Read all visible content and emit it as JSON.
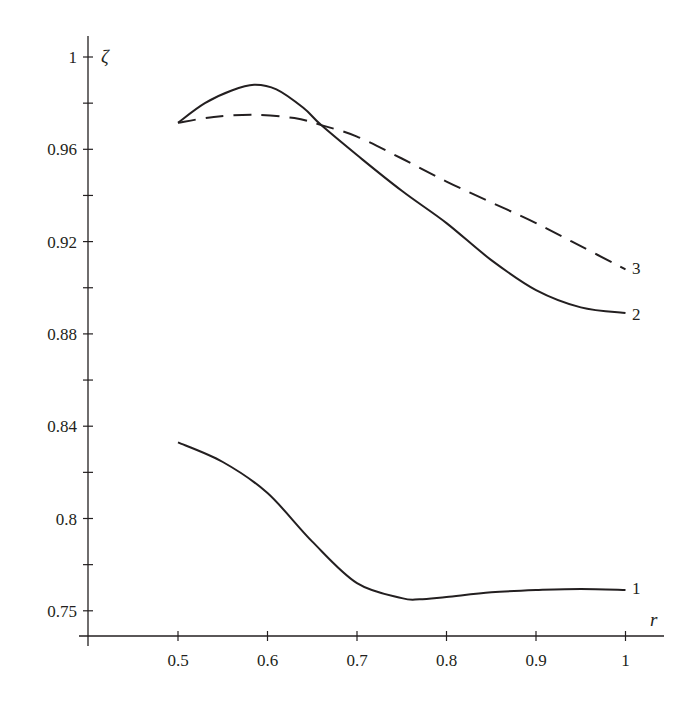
{
  "chart_data": {
    "type": "line",
    "title": "",
    "xlabel": "r",
    "ylabel": "ζ",
    "xlim": [
      0.5,
      1.0
    ],
    "ylim": [
      0.75,
      1.0
    ],
    "grid": false,
    "legend": "inline curve labels at right end",
    "x_ticks": [
      {
        "value": 0.5,
        "label": "0.5"
      },
      {
        "value": 0.6,
        "label": "0.6"
      },
      {
        "value": 0.7,
        "label": "0.7"
      },
      {
        "value": 0.8,
        "label": "0.8"
      },
      {
        "value": 0.9,
        "label": "0.9"
      },
      {
        "value": 1.0,
        "label": "1"
      }
    ],
    "y_ticks": [
      {
        "value": 1.0,
        "label": "1"
      },
      {
        "value": 0.96,
        "label": "0.96"
      },
      {
        "value": 0.92,
        "label": "0.92"
      },
      {
        "value": 0.88,
        "label": "0.88"
      },
      {
        "value": 0.84,
        "label": "0.84"
      },
      {
        "value": 0.8,
        "label": "0.8"
      },
      {
        "value": 0.76,
        "label": "0.75"
      }
    ],
    "y_minor_ticks": [
      0.98,
      0.94,
      0.9,
      0.86,
      0.82,
      0.78
    ],
    "series": [
      {
        "name": "1",
        "style": "solid",
        "x": [
          0.5,
          0.55,
          0.6,
          0.65,
          0.7,
          0.75,
          0.77,
          0.8,
          0.85,
          0.9,
          0.95,
          1.0
        ],
        "values": [
          0.833,
          0.8245,
          0.811,
          0.79,
          0.772,
          0.7655,
          0.765,
          0.766,
          0.768,
          0.769,
          0.7695,
          0.769
        ]
      },
      {
        "name": "2",
        "style": "solid",
        "x": [
          0.5,
          0.53,
          0.56,
          0.585,
          0.61,
          0.64,
          0.66,
          0.7,
          0.75,
          0.8,
          0.85,
          0.9,
          0.95,
          1.0
        ],
        "values": [
          0.9715,
          0.98,
          0.9855,
          0.988,
          0.986,
          0.978,
          0.9705,
          0.9575,
          0.942,
          0.928,
          0.912,
          0.899,
          0.8915,
          0.889
        ]
      },
      {
        "name": "3",
        "style": "dashed",
        "x": [
          0.5,
          0.54,
          0.585,
          0.63,
          0.66,
          0.7,
          0.75,
          0.8,
          0.85,
          0.9,
          0.95,
          1.0
        ],
        "values": [
          0.9715,
          0.974,
          0.975,
          0.9735,
          0.9705,
          0.9655,
          0.956,
          0.946,
          0.937,
          0.928,
          0.918,
          0.908
        ]
      }
    ]
  },
  "labels": {
    "y_axis_title": "ζ",
    "x_axis_title": "r",
    "curve_1": "1",
    "curve_2": "2",
    "curve_3": "3"
  }
}
